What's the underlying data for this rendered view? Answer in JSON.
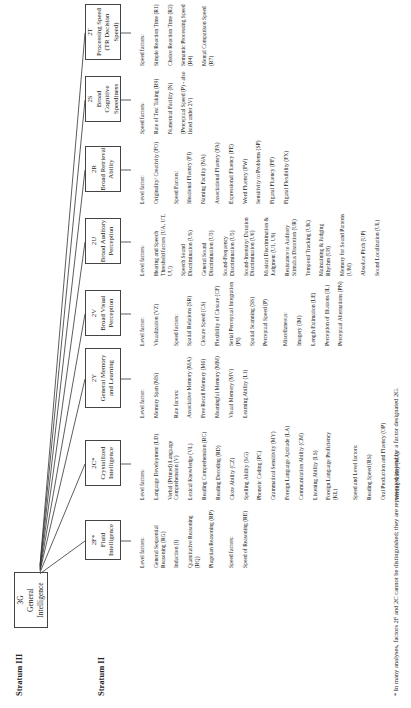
{
  "strata": {
    "stratum3": "Stratum III",
    "stratum2": "Stratum II"
  },
  "general": {
    "code": "3G",
    "name": "General Intelligence"
  },
  "factors": [
    {
      "code": "2F*",
      "name": "Fluid Intelligence",
      "groups": [
        {
          "heading": "Level factors:",
          "items": [
            "General Sequential Reasoning (RG)",
            "Induction (I)",
            "Quantitative Reasoning (RQ)",
            "Piagetian Reasoning (RP)"
          ]
        },
        {
          "heading": "Speed factors:",
          "items": [
            "Speed of Reasoning (RE)"
          ]
        }
      ]
    },
    {
      "code": "2C*",
      "name": "Crystallized Intelligence",
      "groups": [
        {
          "heading": "Level factors:",
          "items": [
            "Language Development (LD)",
            "Verbal (Printed) Language Comprehension (V)",
            "Lexical Knowledge (VL)",
            "Reading Comprehension (RC)",
            "Reading Decoding (RD)",
            "Cloze Ability (CZ)",
            "Spelling Ability (SG)",
            "Phonetic Coding (PC)",
            "Grammatical Sensitivity (MY)",
            "Foreign Language Aptitude (LA)",
            "Communication Ability (CM)",
            "Listening Ability (LS)",
            "Foreign Language Proficiency (KL)"
          ]
        },
        {
          "heading": "Speed and Level factors:",
          "items": [
            "Reading Speed (RS)",
            "Oral Production and Fluency (OP)",
            "Writing Ability (WA)"
          ]
        }
      ]
    },
    {
      "code": "2Y",
      "name": "General Memory and Learning",
      "groups": [
        {
          "heading": "Level factor:",
          "items": [
            "Memory Span (MS)"
          ]
        },
        {
          "heading": "Rate factors:",
          "items": [
            "Associative Memory (MA)",
            "Free Recall Memory (M6)",
            "Meaningful Memory (MM)",
            "Visual Memory (MV)",
            "Learning Ability (L1)"
          ]
        }
      ]
    },
    {
      "code": "2V",
      "name": "Broad Visual Perception",
      "groups": [
        {
          "heading": "Level factor:",
          "items": [
            "Visualization (VZ)"
          ]
        },
        {
          "heading": "Speed factors:",
          "items": [
            "Spatial Relations (SR)",
            "Closure Speed (CS)",
            "Flexibility of Closure (CF)",
            "Serial Perceptual Integration (PI)",
            "Spatial Scanning (SS)",
            "Perceptual Speed (P)"
          ]
        },
        {
          "heading": "Miscellaneous:",
          "items": [
            "Imagery (IM)",
            "Length Estimation (LE)",
            "Perception of Illusions (IL)",
            "Perceptual Alternations (PN)"
          ]
        }
      ]
    },
    {
      "code": "2U",
      "name": "Broad Auditory Perception",
      "groups": [
        {
          "heading": "Level factors:",
          "items": [
            "Hearing and Speech Threshold factors (UA, UT, UU)",
            "Speech Sound Discrimination (US)",
            "General Sound Discrimination (U3)",
            "Sound-Frequency Discrimination (U5)",
            "Sound-Intensity/ Duration Discrimination (U6)",
            "Musical Discrimination & Judgment (U1, U9)",
            "Resistance to Auditory Stimulus Distortion (UR)",
            "Temporal Tracking (UK)",
            "Maintaining & Judging Rhythm (U8)",
            "Memory for Sound Patterns (UM)",
            "Absolute Pitch (UP)",
            "Sound Localization (UL)"
          ]
        }
      ]
    },
    {
      "code": "2R",
      "name": "Broad Retrieval Ability",
      "groups": [
        {
          "heading": "Level factor:",
          "items": [
            "Originality/ Creativity (FO)"
          ]
        },
        {
          "heading": "Speed Factors:",
          "items": [
            "Ideational Fluency (FI)",
            "Naming Facility (NA)",
            "Associational Fluency (FA)",
            "Expressional Fluency (FE)",
            "Word Fluency (FW)",
            "Sensitivity to Problems (SP)",
            "Figural Fluency (FF)",
            "Figural Flexibility (FX)"
          ]
        }
      ]
    },
    {
      "code": "2S",
      "name": "Broad Cognitive Speediness",
      "groups": [
        {
          "heading": "Speed factors:",
          "items": [
            "Rate of Test Taking (R9)",
            "Numerical Facility (N)",
            "(Perceptual Speed (P) - also listed under 2V)"
          ]
        }
      ]
    },
    {
      "code": "2T",
      "name": "Processing Speed (TR Decision Speed)",
      "groups": [
        {
          "heading": "Speed factors:",
          "items": [
            "Simple Reaction Time (R1)",
            "Choice Reaction Time (R2)",
            "Semantic Processing Speed (R4)",
            "Mental Comparison Speed (R7)"
          ]
        }
      ]
    }
  ],
  "footnote": "*   In many analyses, factors 2F and 2C cannot be distinguished; they are represented instead by a factor designated 2G."
}
